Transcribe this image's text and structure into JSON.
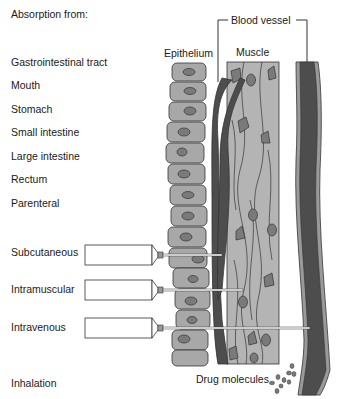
{
  "title": "Absorption from:",
  "routes": {
    "gi_tract": "Gastrointestinal tract",
    "mouth": "Mouth",
    "stomach": "Stomach",
    "small_intestine": "Small intestine",
    "large_intestine": "Large intestine",
    "rectum": "Rectum",
    "parenteral": "Parenteral",
    "subcutaneous": "Subcutaneous",
    "intramuscular": "Intramuscular",
    "intravenous": "Intravenous",
    "inhalation": "Inhalation"
  },
  "tissue_labels": {
    "blood_vessel": "Blood vessel",
    "epithelium": "Epithelium",
    "muscle": "Muscle",
    "drug_molecules": "Drug molecules"
  },
  "colors": {
    "epithelium_cell": "#a8a8a8",
    "nucleus": "#7a7a7a",
    "muscle": "#b4b4b4",
    "vessel_dark": "#4d4d4d",
    "vessel_wall": "#9a9a9a",
    "outline": "#333333"
  }
}
